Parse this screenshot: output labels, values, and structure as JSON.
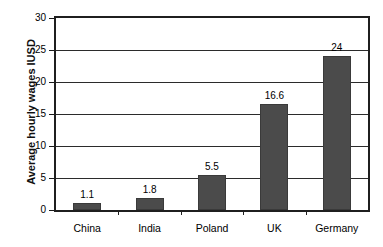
{
  "chart_data": {
    "type": "bar",
    "title": "",
    "xlabel": "",
    "ylabel": "Average hourly wages IUSD",
    "categories": [
      "China",
      "India",
      "Poland",
      "UK",
      "Germany"
    ],
    "values": [
      1.1,
      1.8,
      5.5,
      16.6,
      24
    ],
    "value_labels": [
      "1.1",
      "1.8",
      "5.5",
      "16.6",
      "24"
    ],
    "ylim": [
      0,
      30
    ],
    "yticks": [
      0,
      5,
      10,
      15,
      20,
      25,
      30
    ],
    "ytick_labels": [
      "0",
      "5",
      "10",
      "15",
      "20",
      "25",
      "30"
    ],
    "grid": true,
    "grid_axis": "y",
    "legend": "none",
    "bar_color": "#4b4b4b",
    "axis_color": "#1f1f1f",
    "background_color": "#ffffff",
    "series": [
      {
        "name": "Average hourly wages",
        "values": [
          1.1,
          1.8,
          5.5,
          16.6,
          24
        ]
      }
    ]
  }
}
